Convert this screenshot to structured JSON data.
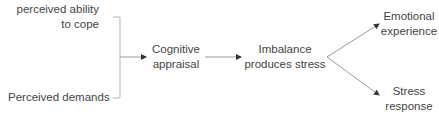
{
  "diagram": {
    "inputs": {
      "ability": {
        "line1": "perceived ability",
        "line2": "to cope"
      },
      "demands": {
        "line1": "Perceived demands"
      }
    },
    "appraisal": {
      "line1": "Cognitive",
      "line2": "appraisal"
    },
    "imbalance": {
      "line1": "Imbalance",
      "line2": "produces stress"
    },
    "outcomes": {
      "emotional": {
        "line1": "Emotional",
        "line2": "experience"
      },
      "stress": {
        "line1": "Stress",
        "line2": "response"
      }
    },
    "edges": [
      {
        "from": "perceived ability to cope + Perceived demands",
        "to": "Cognitive appraisal"
      },
      {
        "from": "Cognitive appraisal",
        "to": "Imbalance produces stress"
      },
      {
        "from": "Imbalance produces stress",
        "to": "Emotional experience"
      },
      {
        "from": "Imbalance produces stress",
        "to": "Stress response"
      }
    ],
    "colors": {
      "text": "#444444",
      "line": "#aaaaaa",
      "arrowhead": "#333333"
    }
  }
}
